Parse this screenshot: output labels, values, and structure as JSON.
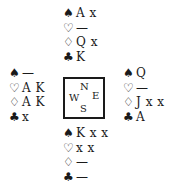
{
  "diagram": {
    "type": "bridge-deal",
    "compass": {
      "north": "N",
      "south": "S",
      "east": "E",
      "west": "W"
    },
    "suit_symbols": {
      "spades": "♠",
      "hearts": "♡",
      "diamonds": "♢",
      "clubs": "♣"
    },
    "hands": {
      "north": {
        "spades": "A x",
        "hearts": "—",
        "diamonds": "Q x",
        "clubs": "K"
      },
      "west": {
        "spades": "—",
        "hearts": "A K",
        "diamonds": "A K",
        "clubs": "x"
      },
      "east": {
        "spades": "Q",
        "hearts": "—",
        "diamonds": "J x x",
        "clubs": "A"
      },
      "south": {
        "spades": "K x x",
        "hearts": "x x",
        "diamonds": "—",
        "clubs": "—"
      }
    }
  }
}
